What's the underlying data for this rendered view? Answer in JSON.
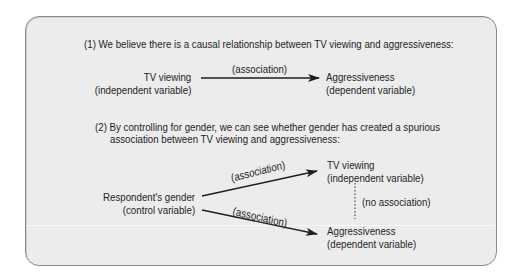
{
  "section1": {
    "heading": "(1) We believe there is a causal relationship between TV viewing and aggressiveness:",
    "source": {
      "name": "TV viewing",
      "role": "(independent variable)"
    },
    "arrow_label": "(association)",
    "target": {
      "name": "Aggressiveness",
      "role": "(dependent variable)"
    }
  },
  "section2": {
    "heading_line1": "(2) By controlling for gender, we can see whether gender has created a spurious",
    "heading_line2": "association between TV viewing and aggressiveness:",
    "control": {
      "name": "Respondent's gender",
      "role": "(control variable)"
    },
    "upper_arrow_label": "(association)",
    "lower_arrow_label": "(association)",
    "top_target": {
      "name": "TV viewing",
      "role": "(independent variable)"
    },
    "bottom_target": {
      "name": "Aggressiveness",
      "role": "(dependent variable)"
    },
    "dotted_label": "(no association)"
  },
  "colors": {
    "panel_bg": "#ececec",
    "panel_border": "#8a8a8a",
    "text": "#1e1e1e"
  }
}
